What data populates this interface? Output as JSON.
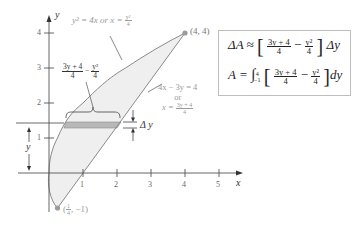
{
  "figure": {
    "type": "area-between-curves",
    "axes": {
      "x_label": "x",
      "y_label": "y",
      "x_ticks": [
        "1",
        "2",
        "3",
        "4",
        "5"
      ],
      "y_ticks": [
        "1",
        "2",
        "3",
        "4"
      ]
    },
    "curves": {
      "parabola": {
        "label_lhs": "y² = 4x or x = ",
        "label_frac_num": "y²",
        "label_frac_den": "4"
      },
      "line": {
        "label_line1": "4x − 3y = 4",
        "label_line2": "or",
        "label_lhs": "x = ",
        "label_frac_num": "3y + 4",
        "label_frac_den": "4"
      }
    },
    "points": {
      "top": {
        "label": "(4, 4)"
      },
      "bottom": {
        "label_open": "(",
        "label_frac_num": "1",
        "label_frac_den": "4",
        "label_rest": ", −1)"
      }
    },
    "strip_width_label": {
      "frac1_num": "3y + 4",
      "frac1_den": "4",
      "minus": "−",
      "frac2_num": "y²",
      "frac2_den": "4"
    },
    "delta_y_label": "Δ y",
    "height_label": "y",
    "colors": {
      "region_fill": "#ededed",
      "strip_fill": "#b5b5b5",
      "curve": "#8a8a8a",
      "axis": "#555555",
      "point": "#9b9b9b"
    }
  },
  "formula_box": {
    "row1": {
      "lhs": "ΔA ≈",
      "frac1_num": "3y + 4",
      "frac1_den": "4",
      "minus": "−",
      "frac2_num": "y²",
      "frac2_den": "4",
      "rhs": "Δy"
    },
    "row2": {
      "lhs": "A =",
      "integral": "∫",
      "upper": "4",
      "lower": "−1",
      "frac1_num": "3y + 4",
      "frac1_den": "4",
      "minus": "−",
      "frac2_num": "y²",
      "frac2_den": "4",
      "rhs": "dy"
    }
  }
}
